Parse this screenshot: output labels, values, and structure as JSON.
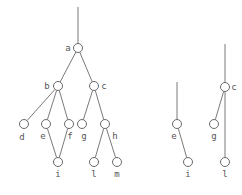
{
  "diagram": {
    "type": "tree-graph",
    "colors": {
      "edge": "#7a7a7a",
      "node_stroke": "#6a6a6a",
      "label": "#555555",
      "background": "#ffffff"
    },
    "node_radius": 4.5,
    "graphs": [
      {
        "name": "main-graph",
        "stem": {
          "x1": 78,
          "y1": 7,
          "x2": 78,
          "y2": 44
        },
        "nodes": [
          {
            "id": "a",
            "label": "a",
            "x": 78,
            "y": 48,
            "lx": 68,
            "ly": 51,
            "anchor": "middle"
          },
          {
            "id": "b",
            "label": "b",
            "x": 58,
            "y": 86,
            "lx": 47,
            "ly": 89,
            "anchor": "middle"
          },
          {
            "id": "c",
            "label": "c",
            "x": 94,
            "y": 86,
            "lx": 104,
            "ly": 89,
            "anchor": "middle"
          },
          {
            "id": "d",
            "label": "d",
            "x": 24,
            "y": 124,
            "lx": 22,
            "ly": 140,
            "anchor": "middle"
          },
          {
            "id": "e",
            "label": "e",
            "x": 46,
            "y": 124,
            "lx": 43,
            "ly": 139,
            "anchor": "middle"
          },
          {
            "id": "f",
            "label": "f",
            "x": 69,
            "y": 124,
            "lx": 70,
            "ly": 139,
            "anchor": "middle"
          },
          {
            "id": "g",
            "label": "g",
            "x": 82,
            "y": 124,
            "lx": 84,
            "ly": 139,
            "anchor": "middle"
          },
          {
            "id": "h",
            "label": "h",
            "x": 105,
            "y": 124,
            "lx": 115,
            "ly": 139,
            "anchor": "middle"
          },
          {
            "id": "i",
            "label": "i",
            "x": 58,
            "y": 162,
            "lx": 58,
            "ly": 177,
            "anchor": "middle"
          },
          {
            "id": "l",
            "label": "l",
            "x": 94,
            "y": 162,
            "lx": 94,
            "ly": 177,
            "anchor": "middle"
          },
          {
            "id": "m",
            "label": "m",
            "x": 117,
            "y": 162,
            "lx": 117,
            "ly": 177,
            "anchor": "middle"
          }
        ],
        "edges": [
          [
            "a",
            "b"
          ],
          [
            "a",
            "c"
          ],
          [
            "b",
            "d"
          ],
          [
            "b",
            "e"
          ],
          [
            "b",
            "f"
          ],
          [
            "c",
            "g"
          ],
          [
            "c",
            "h"
          ],
          [
            "e",
            "i"
          ],
          [
            "f",
            "i"
          ],
          [
            "h",
            "l"
          ],
          [
            "h",
            "m"
          ]
        ]
      },
      {
        "name": "subgraph-e-i",
        "stem": {
          "x1": 177,
          "y1": 82,
          "x2": 177,
          "y2": 120
        },
        "nodes": [
          {
            "id": "e",
            "label": "e",
            "x": 177,
            "y": 124,
            "lx": 174,
            "ly": 139,
            "anchor": "middle"
          },
          {
            "id": "i",
            "label": "i",
            "x": 188,
            "y": 162,
            "lx": 188,
            "ly": 177,
            "anchor": "middle"
          }
        ],
        "edges": [
          [
            "e",
            "i"
          ]
        ]
      },
      {
        "name": "subgraph-c-g-l",
        "stem": {
          "x1": 225,
          "y1": 44,
          "x2": 225,
          "y2": 83
        },
        "nodes": [
          {
            "id": "c",
            "label": "c",
            "x": 225,
            "y": 87,
            "lx": 234,
            "ly": 90,
            "anchor": "middle"
          },
          {
            "id": "g",
            "label": "g",
            "x": 214,
            "y": 124,
            "lx": 214,
            "ly": 139,
            "anchor": "middle"
          },
          {
            "id": "l",
            "label": "l",
            "x": 225,
            "y": 162,
            "lx": 225,
            "ly": 177,
            "anchor": "middle"
          }
        ],
        "edges": [
          [
            "c",
            "g"
          ],
          [
            "c",
            "l"
          ]
        ]
      }
    ]
  }
}
